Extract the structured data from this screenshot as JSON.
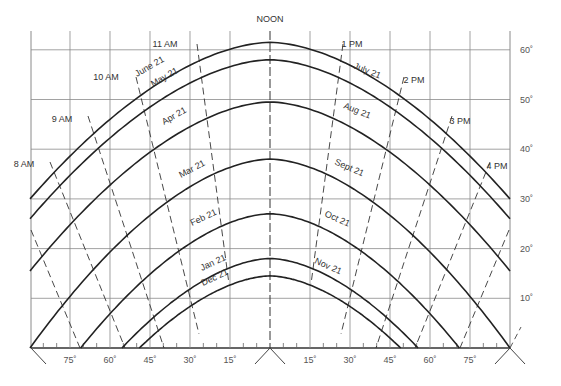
{
  "diagram": {
    "noon_label": "NOON",
    "frame": {
      "left_px": 31,
      "right_px": 510,
      "center_px": 270,
      "top_px": 31,
      "baseline_px": 348,
      "px_per_deg_az": 2.6667,
      "px_per_deg_alt": 4.97
    },
    "colors": {
      "grid": "#8a8a8a",
      "curve": "#222222",
      "hour_line": "#333333",
      "text": "#333333",
      "background": "#ffffff"
    },
    "altitude_gridlines": [
      10,
      20,
      30,
      40,
      50,
      60
    ],
    "altitude_labels": [
      "10˚",
      "20˚",
      "30˚",
      "40˚",
      "50˚",
      "60˚"
    ],
    "azimuth_gridlines": [
      -75,
      -60,
      -45,
      -30,
      -15,
      0,
      15,
      30,
      45,
      60,
      75
    ],
    "azimuth_labels": [
      {
        "az": -75,
        "text": "75˚"
      },
      {
        "az": -60,
        "text": "60˚"
      },
      {
        "az": -45,
        "text": "45˚"
      },
      {
        "az": -30,
        "text": "30˚"
      },
      {
        "az": -15,
        "text": "15˚"
      },
      {
        "az": 15,
        "text": "15˚"
      },
      {
        "az": 30,
        "text": "30˚"
      },
      {
        "az": 45,
        "text": "45˚"
      },
      {
        "az": 60,
        "text": "60˚"
      },
      {
        "az": 75,
        "text": "75˚"
      }
    ],
    "date_curves": [
      {
        "label": "June 21",
        "peak_alt": 61.5,
        "edge_az": 90,
        "edge_alt": 30,
        "label_pos": {
          "x": 137,
          "y": 77,
          "rot": -30
        }
      },
      {
        "label": "May 21",
        "peak_alt": 58,
        "edge_az": 90,
        "edge_alt": 26,
        "label_pos": {
          "x": 153,
          "y": 87,
          "rot": -30
        }
      },
      {
        "label": "July 21",
        "peak_alt": 58,
        "edge_az": 90,
        "edge_alt": 26,
        "mirror": true,
        "label_pos": {
          "x": 353,
          "y": 68,
          "rot": 22
        }
      },
      {
        "label": "Apr 21",
        "peak_alt": 49.5,
        "edge_az": 90,
        "edge_alt": 15.5,
        "label_pos": {
          "x": 164,
          "y": 125,
          "rot": -30
        }
      },
      {
        "label": "Aug 21",
        "peak_alt": 49.5,
        "edge_az": 90,
        "edge_alt": 15.5,
        "mirror": true,
        "label_pos": {
          "x": 343,
          "y": 108,
          "rot": 22
        }
      },
      {
        "label": "Mar 21",
        "peak_alt": 38,
        "edge_az": 90,
        "edge_alt": 0,
        "label_pos": {
          "x": 181,
          "y": 178,
          "rot": -28
        }
      },
      {
        "label": "Sept 21",
        "peak_alt": 38,
        "edge_az": 90,
        "edge_alt": 0,
        "mirror": true,
        "label_pos": {
          "x": 334,
          "y": 164,
          "rot": 24
        }
      },
      {
        "label": "Feb 21",
        "peak_alt": 27,
        "edge_az": 71,
        "edge_alt": 0,
        "label_pos": {
          "x": 192,
          "y": 226,
          "rot": -25
        }
      },
      {
        "label": "Oct 21",
        "peak_alt": 27,
        "edge_az": 71,
        "edge_alt": 0,
        "mirror": true,
        "label_pos": {
          "x": 324,
          "y": 216,
          "rot": 24
        }
      },
      {
        "label": "Jan 21",
        "peak_alt": 18,
        "edge_az": 55.5,
        "edge_alt": 0,
        "label_pos": {
          "x": 202,
          "y": 271,
          "rot": -25
        }
      },
      {
        "label": "Nov 21",
        "peak_alt": 18,
        "edge_az": 55.5,
        "edge_alt": 0,
        "mirror": true,
        "label_pos": {
          "x": 314,
          "y": 263,
          "rot": 24
        }
      },
      {
        "label": "Dec 21",
        "peak_alt": 14.5,
        "edge_az": 49,
        "edge_alt": 0,
        "label_pos": {
          "x": 203,
          "y": 286,
          "rot": -25
        }
      }
    ],
    "hour_lines": [
      {
        "left_label": "11 AM",
        "right_label": "1 PM",
        "top": {
          "x": 197,
          "y": 44
        },
        "bottom": {
          "x": 229,
          "y": 284
        },
        "left_label_pos": {
          "x": 165,
          "y": 47
        },
        "right_label_pos": {
          "x": 352,
          "y": 47
        }
      },
      {
        "left_label": "10 AM",
        "right_label": "2 PM",
        "top": {
          "x": 136,
          "y": 77
        },
        "bottom": {
          "x": 199,
          "y": 334
        },
        "left_label_pos": {
          "x": 106,
          "y": 80
        },
        "right_label_pos": {
          "x": 414,
          "y": 83
        }
      },
      {
        "left_label": "9 AM",
        "right_label": "3 PM",
        "top": {
          "x": 88,
          "y": 116
        },
        "bottom": {
          "x": 164,
          "y": 348
        },
        "left_label_pos": {
          "x": 62,
          "y": 122
        },
        "right_label_pos": {
          "x": 460,
          "y": 124
        }
      },
      {
        "left_label": "8 AM",
        "right_label": "4 PM",
        "top": {
          "x": 50,
          "y": 162
        },
        "bottom": {
          "x": 125,
          "y": 348
        },
        "left_label_pos": {
          "x": 24,
          "y": 167
        },
        "right_label_pos": {
          "x": 497,
          "y": 169
        }
      },
      {
        "left_label": "",
        "right_label": "",
        "top": {
          "x": 31,
          "y": 230
        },
        "bottom": {
          "x": 80,
          "y": 348
        },
        "left_label_pos": null,
        "right_label_pos": null
      }
    ],
    "extra_right_tick": {
      "from": {
        "x": 510,
        "y": 348
      },
      "to": {
        "x": 521,
        "y": 327
      }
    }
  }
}
